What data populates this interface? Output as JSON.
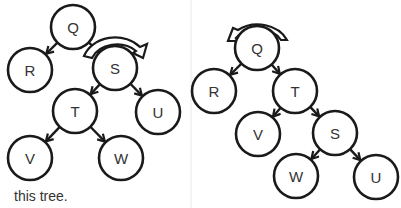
{
  "caption": "this tree.",
  "colors": {
    "stroke": "#1a1a1a",
    "fill": "#ffffff",
    "label": "#333333",
    "divider": "#e8e8e8"
  },
  "node_radius": 22,
  "trees": [
    {
      "name": "before-rotation",
      "rotation_arrow": {
        "around": "S",
        "direction": "clockwise",
        "icon": "curved-arrow-right"
      },
      "nodes": [
        {
          "id": "Q",
          "label": "Q",
          "x": 73,
          "y": 27
        },
        {
          "id": "R",
          "label": "R",
          "x": 30,
          "y": 70
        },
        {
          "id": "S",
          "label": "S",
          "x": 115,
          "y": 68
        },
        {
          "id": "T",
          "label": "T",
          "x": 75,
          "y": 111
        },
        {
          "id": "U",
          "label": "U",
          "x": 158,
          "y": 112
        },
        {
          "id": "V",
          "label": "V",
          "x": 30,
          "y": 158
        },
        {
          "id": "W",
          "label": "W",
          "x": 121,
          "y": 158
        }
      ],
      "edges": [
        [
          "Q",
          "R"
        ],
        [
          "Q",
          "S"
        ],
        [
          "S",
          "T"
        ],
        [
          "S",
          "U"
        ],
        [
          "T",
          "V"
        ],
        [
          "T",
          "W"
        ]
      ]
    },
    {
      "name": "after-rotation",
      "rotation_arrow": {
        "around": "Q",
        "direction": "counter-clockwise",
        "icon": "curved-arrow-left"
      },
      "nodes": [
        {
          "id": "Q",
          "label": "Q",
          "x": 257,
          "y": 48
        },
        {
          "id": "R",
          "label": "R",
          "x": 214,
          "y": 91
        },
        {
          "id": "T",
          "label": "T",
          "x": 295,
          "y": 91
        },
        {
          "id": "V",
          "label": "V",
          "x": 258,
          "y": 134
        },
        {
          "id": "S",
          "label": "S",
          "x": 335,
          "y": 133
        },
        {
          "id": "W",
          "label": "W",
          "x": 296,
          "y": 176
        },
        {
          "id": "U",
          "label": "U",
          "x": 376,
          "y": 177
        }
      ],
      "edges": [
        [
          "Q",
          "R"
        ],
        [
          "Q",
          "T"
        ],
        [
          "T",
          "V"
        ],
        [
          "T",
          "S"
        ],
        [
          "S",
          "W"
        ],
        [
          "S",
          "U"
        ]
      ]
    }
  ]
}
